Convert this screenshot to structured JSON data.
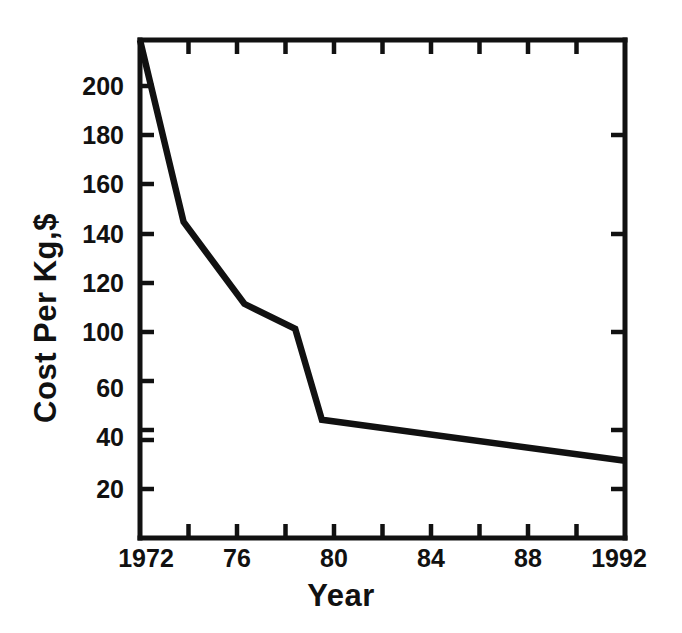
{
  "chart_data": {
    "type": "line",
    "title": "",
    "xlabel": "Year",
    "ylabel": "Cost Per Kg,$",
    "xlim": [
      1972,
      1992
    ],
    "ylim": [
      0,
      219
    ],
    "grid": false,
    "legend": null,
    "x": [
      1972,
      1973.8,
      1976.3,
      1978.4,
      1979.5,
      1992
    ],
    "y": [
      219,
      139,
      103,
      92,
      52,
      34
    ],
    "series": [
      {
        "name": "Cost Per Kg",
        "x": [
          1972,
          1973.8,
          1976.3,
          1978.4,
          1979.5,
          1992
        ],
        "values": [
          219,
          139,
          103,
          92,
          52,
          34
        ]
      }
    ],
    "y_ticks": [
      20,
      40,
      60,
      80,
      100,
      120,
      140,
      160,
      180,
      200
    ],
    "y_tick_labels": [
      "20",
      "40",
      "60",
      "80",
      "100",
      "120",
      "140",
      "160",
      "180",
      "200"
    ],
    "x_ticks": [
      1972,
      1976,
      1980,
      1984,
      1988,
      1992
    ],
    "x_tick_labels": [
      "1972",
      "76",
      "80",
      "84",
      "88",
      "1992"
    ],
    "x_minor_ticks": [
      1974,
      1978,
      1982,
      1986,
      1990
    ],
    "line_color": "#111111",
    "axis_color": "#111111",
    "background_color": "#ffffff"
  },
  "axes": {
    "y_labels": {
      "t200": "200",
      "t180": "180",
      "t160": "160",
      "t140": "140",
      "t120": "120",
      "t100": "100",
      "t80": "80",
      "t60": "60",
      "t40": "40",
      "t20": "20"
    },
    "x_labels": {
      "t1972": "1972",
      "t1976": "76",
      "t1980": "80",
      "t1984": "84",
      "t1988": "88",
      "t1992": "1992"
    },
    "y_title": "Cost Per Kg,$",
    "x_title": "Year"
  }
}
